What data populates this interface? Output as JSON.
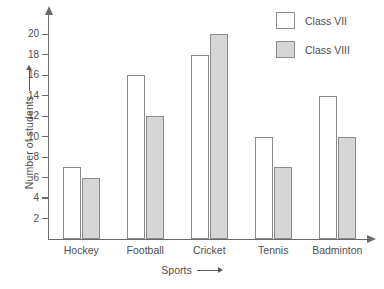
{
  "chart_data": {
    "type": "bar",
    "title": "",
    "subtitle": "",
    "xlabel": "Sports",
    "ylabel": "Number of students",
    "xlabel_arrow": "right-arrow",
    "ylabel_arrow": "up-arrow",
    "categories": [
      "Hockey",
      "Football",
      "Cricket",
      "Tennis",
      "Badminton"
    ],
    "series": [
      {
        "name": "Class VII",
        "values": [
          7,
          16,
          18,
          10,
          14
        ],
        "fill": "#ffffff",
        "border": "#8c8c8c"
      },
      {
        "name": "Class VIII",
        "values": [
          6,
          12,
          20,
          7,
          10
        ],
        "fill": "#d6d6d6",
        "border": "#8c8c8c"
      }
    ],
    "ylim": [
      0,
      22
    ],
    "ytick_values": [
      2,
      4,
      6,
      8,
      10,
      12,
      14,
      16,
      18,
      20
    ],
    "ytick_labels": [
      "2",
      "4",
      "6",
      "8",
      "10",
      "12",
      "14",
      "16",
      "18",
      "20"
    ],
    "grid": false,
    "legend_position": "top-right"
  },
  "legend": {
    "items": [
      {
        "label": "Class VII",
        "swatch": "white-square"
      },
      {
        "label": "Class VIII",
        "swatch": "gray-square"
      }
    ]
  },
  "axes": {
    "y_axis_label": "Number of students",
    "x_axis_label": "Sports"
  },
  "colors": {
    "class7_fill": "#ffffff",
    "class8_fill": "#d6d6d6",
    "bar_border": "#8c8c8c",
    "axis": "#6b6b6b",
    "text": "#4f4f4f",
    "background": "#ffffff"
  }
}
